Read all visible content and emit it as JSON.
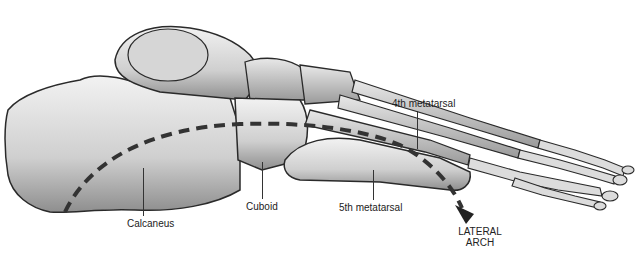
{
  "diagram": {
    "labels": {
      "fourth_metatarsal": "4th metatarsal",
      "calcaneus": "Calcaneus",
      "cuboid": "Cuboid",
      "fifth_metatarsal": "5th metatarsal",
      "lateral_arch_line1": "LATERAL",
      "lateral_arch_line2": "ARCH"
    },
    "colors": {
      "bone_fill": "#d9d9d9",
      "bone_shadow": "#8c8c8c",
      "outline": "#2a2a2a",
      "arch_line": "#333333",
      "background": "#ffffff"
    }
  }
}
